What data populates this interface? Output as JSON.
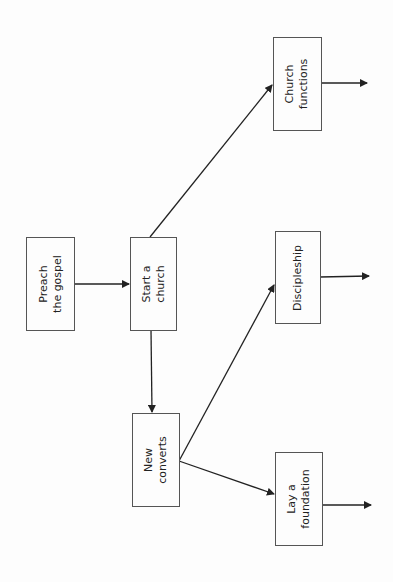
{
  "diagram": {
    "type": "flowchart",
    "orientation": "rotated-90-ccw",
    "nodes": [
      {
        "id": "preach",
        "label": "Preach\nthe gospel"
      },
      {
        "id": "start",
        "label": "Start a\nchurch"
      },
      {
        "id": "converts",
        "label": "New\nconverts"
      },
      {
        "id": "functions",
        "label": "Church\nfunctions"
      },
      {
        "id": "discipleship",
        "label": "Discipleship"
      },
      {
        "id": "foundation",
        "label": "Lay a\nfoundation"
      }
    ],
    "edges": [
      {
        "from": "preach",
        "to": "start"
      },
      {
        "from": "start",
        "to": "functions"
      },
      {
        "from": "start",
        "to": "converts"
      },
      {
        "from": "converts",
        "to": "discipleship"
      },
      {
        "from": "converts",
        "to": "foundation"
      },
      {
        "from": "functions",
        "to": "(continues)"
      },
      {
        "from": "discipleship",
        "to": "(continues)"
      },
      {
        "from": "foundation",
        "to": "(continues)"
      }
    ],
    "colors": {
      "line": "#222222",
      "box_border": "#555555",
      "background": "#fdfdfd"
    }
  }
}
